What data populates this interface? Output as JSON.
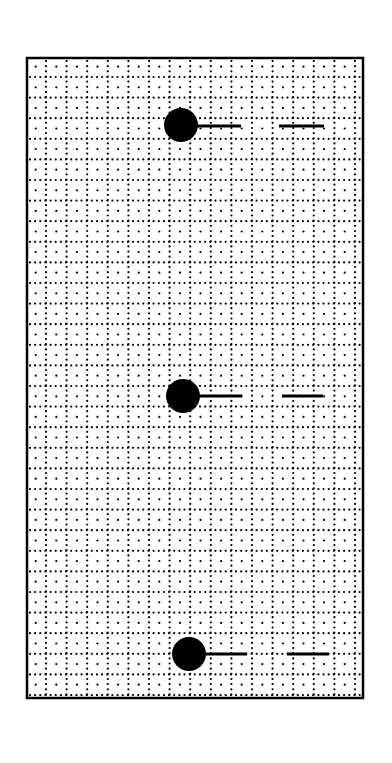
{
  "diagram": {
    "canvas": {
      "width": 392,
      "height": 763,
      "background": "#ffffff"
    },
    "frame": {
      "x": 27,
      "y": 58,
      "width": 336,
      "height": 640,
      "stroke": "#000000",
      "stroke_width": 2.5
    },
    "grid": {
      "cell": 20.6,
      "offset_x": 46,
      "offset_y": 77,
      "dot_color": "#000000",
      "dot_radius": 1.1,
      "line_dot_spacing": 5.15,
      "center_dots": true
    },
    "figures": [
      {
        "id": "figure-1",
        "ball": {
          "cx": 181,
          "cy": 125,
          "r": 17
        },
        "stick": {
          "x1": 197,
          "x2": 241,
          "y": 126
        },
        "dash": {
          "x1": 279,
          "x2": 324,
          "y": 126
        }
      },
      {
        "id": "figure-2",
        "ball": {
          "cx": 183,
          "cy": 396,
          "r": 17
        },
        "stick": {
          "x1": 199,
          "x2": 242,
          "y": 396
        },
        "dash": {
          "x1": 282,
          "x2": 323,
          "y": 396
        }
      },
      {
        "id": "figure-3",
        "ball": {
          "cx": 189,
          "cy": 654,
          "r": 17
        },
        "stick": {
          "x1": 205,
          "x2": 247,
          "y": 654
        },
        "dash": {
          "x1": 287,
          "x2": 329,
          "y": 654
        }
      }
    ],
    "ink_color": "#000000",
    "stick_width": 3
  }
}
